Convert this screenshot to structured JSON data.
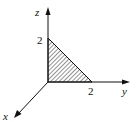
{
  "diagram": {
    "type": "3d-coordinate-axes-with-shaded-triangle",
    "axes": {
      "x": {
        "label": "x"
      },
      "y": {
        "label": "y",
        "tick_label": "2"
      },
      "z": {
        "label": "z",
        "tick_label": "2"
      }
    },
    "region": {
      "description": "Hatched right triangle in the yz-plane with vertices (0,0,0), (0,2,0), (0,0,2)",
      "fill": "diagonal-hatch"
    },
    "colors": {
      "stroke": "#111111",
      "background": "#ffffff"
    }
  }
}
